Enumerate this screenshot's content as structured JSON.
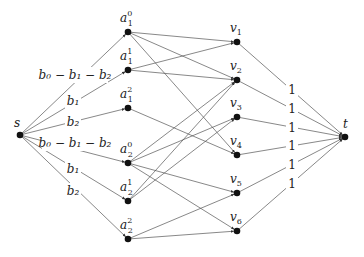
{
  "diagram": {
    "type": "flow-network",
    "nodes": [
      {
        "id": "s",
        "label": "s",
        "sup": "",
        "x": 20,
        "y": 135,
        "lx": 14,
        "ly": 127
      },
      {
        "id": "a10",
        "label": "a",
        "sub": "1",
        "sup": "0",
        "x": 128,
        "y": 32,
        "lx": 120,
        "ly": 22
      },
      {
        "id": "a11",
        "label": "a",
        "sub": "1",
        "sup": "1",
        "x": 128,
        "y": 70,
        "lx": 120,
        "ly": 60
      },
      {
        "id": "a12",
        "label": "a",
        "sub": "1",
        "sup": "2",
        "x": 128,
        "y": 108,
        "lx": 120,
        "ly": 98
      },
      {
        "id": "a20",
        "label": "a",
        "sub": "2",
        "sup": "0",
        "x": 128,
        "y": 163,
        "lx": 120,
        "ly": 153
      },
      {
        "id": "a21",
        "label": "a",
        "sub": "2",
        "sup": "1",
        "x": 128,
        "y": 201,
        "lx": 120,
        "ly": 191
      },
      {
        "id": "a22",
        "label": "a",
        "sub": "2",
        "sup": "2",
        "x": 128,
        "y": 239,
        "lx": 120,
        "ly": 229
      },
      {
        "id": "v1",
        "label": "v",
        "sub": "1",
        "x": 237,
        "y": 42,
        "lx": 230,
        "ly": 32
      },
      {
        "id": "v2",
        "label": "v",
        "sub": "2",
        "x": 237,
        "y": 80,
        "lx": 230,
        "ly": 70
      },
      {
        "id": "v3",
        "label": "v",
        "sub": "3",
        "x": 237,
        "y": 117,
        "lx": 230,
        "ly": 107
      },
      {
        "id": "v4",
        "label": "v",
        "sub": "4",
        "x": 237,
        "y": 155,
        "lx": 230,
        "ly": 145
      },
      {
        "id": "v5",
        "label": "v",
        "sub": "5",
        "x": 237,
        "y": 193,
        "lx": 230,
        "ly": 183
      },
      {
        "id": "v6",
        "label": "v",
        "sub": "6",
        "x": 237,
        "y": 231,
        "lx": 230,
        "ly": 221
      },
      {
        "id": "t",
        "label": "t",
        "x": 345,
        "y": 137,
        "lx": 343,
        "ly": 128
      }
    ],
    "edge_labels_left": [
      {
        "text": "b₀ − b₁ − b₂",
        "x": 75,
        "y": 79
      },
      {
        "text": "b₁",
        "x": 73,
        "y": 105
      },
      {
        "text": "b₂",
        "x": 73,
        "y": 126
      },
      {
        "text": "b₀ − b₁ − b₂",
        "x": 75,
        "y": 147
      },
      {
        "text": "b₁",
        "x": 73,
        "y": 173
      },
      {
        "text": "b₂",
        "x": 73,
        "y": 195
      }
    ],
    "edge_labels_right": [
      {
        "text": "1",
        "x": 292,
        "y": 94
      },
      {
        "text": "1",
        "x": 292,
        "y": 113
      },
      {
        "text": "1",
        "x": 292,
        "y": 132
      },
      {
        "text": "1",
        "x": 292,
        "y": 150
      },
      {
        "text": "1",
        "x": 292,
        "y": 169
      },
      {
        "text": "1",
        "x": 292,
        "y": 188
      }
    ],
    "edges": [
      {
        "from": "s",
        "to": "a10"
      },
      {
        "from": "s",
        "to": "a11"
      },
      {
        "from": "s",
        "to": "a12"
      },
      {
        "from": "s",
        "to": "a20"
      },
      {
        "from": "s",
        "to": "a21"
      },
      {
        "from": "s",
        "to": "a22"
      },
      {
        "from": "a10",
        "to": "v1"
      },
      {
        "from": "a10",
        "to": "v2"
      },
      {
        "from": "a10",
        "to": "v4"
      },
      {
        "from": "a11",
        "to": "v1"
      },
      {
        "from": "a11",
        "to": "v2"
      },
      {
        "from": "a12",
        "to": "v4"
      },
      {
        "from": "a20",
        "to": "v2"
      },
      {
        "from": "a20",
        "to": "v3"
      },
      {
        "from": "a20",
        "to": "v5"
      },
      {
        "from": "a20",
        "to": "v6"
      },
      {
        "from": "a21",
        "to": "v2"
      },
      {
        "from": "a21",
        "to": "v3"
      },
      {
        "from": "a22",
        "to": "v5"
      },
      {
        "from": "a22",
        "to": "v6"
      },
      {
        "from": "v1",
        "to": "t"
      },
      {
        "from": "v2",
        "to": "t"
      },
      {
        "from": "v3",
        "to": "t"
      },
      {
        "from": "v4",
        "to": "t"
      },
      {
        "from": "v5",
        "to": "t"
      },
      {
        "from": "v6",
        "to": "t"
      }
    ],
    "colors": {
      "edge": "#555555",
      "node": "#111111",
      "text": "#222222"
    }
  }
}
